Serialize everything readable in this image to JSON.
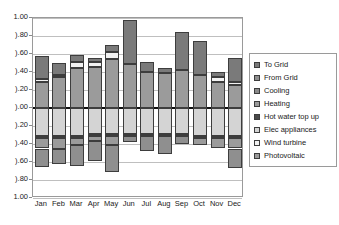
{
  "chart_data": {
    "type": "bar",
    "title": "",
    "subtitle": "",
    "xlabel": "",
    "ylabel": "",
    "stacked": true,
    "diverging": true,
    "grid": true,
    "legend_position": "right",
    "categories": [
      "Jan",
      "Feb",
      "Mar",
      "Apr",
      "May",
      "Jun",
      "Jul",
      "Aug",
      "Sep",
      "Oct",
      "Nov",
      "Dec"
    ],
    "ylim": [
      -1.0,
      1.0
    ],
    "ytick_step": 0.2,
    "ytick_labels": [
      "1.00",
      "0.80",
      "0.60",
      "0.40",
      "0.20",
      "0.00",
      "-0.20",
      "-0.40",
      "-0.60",
      "-0.80",
      "-1.00"
    ],
    "ytick_values": [
      1.0,
      0.8,
      0.6,
      0.4,
      0.2,
      0.0,
      -0.2,
      -0.4,
      -0.6,
      -0.8,
      -1.0
    ],
    "ytick_labels_clipped": [
      "1.00",
      ").80",
      ").60",
      ").40",
      ").20",
      ").00",
      ").20",
      ").40",
      ").60",
      ").80",
      "1.00"
    ],
    "series": [
      {
        "name": "To Grid",
        "color": "#7a7a7a",
        "sign": "positive",
        "values": [
          0.26,
          0.13,
          0.08,
          0.05,
          0.08,
          0.49,
          0.11,
          0.06,
          0.42,
          0.37,
          0.06,
          0.27
        ]
      },
      {
        "name": "From Grid",
        "color": "#8f8f8f",
        "sign": "negative",
        "values": [
          -0.21,
          -0.16,
          -0.23,
          -0.22,
          -0.3,
          -0.07,
          -0.17,
          -0.2,
          -0.09,
          -0.0,
          -0.0,
          -0.22
        ]
      },
      {
        "name": "Cooling",
        "color": "#8a8a8a",
        "sign": "negative",
        "values": [
          0.0,
          0.0,
          0.0,
          0.0,
          0.0,
          0.0,
          0.0,
          0.0,
          0.0,
          0.0,
          0.0,
          0.0
        ]
      },
      {
        "name": "Heating",
        "color": "#9b9b9b",
        "sign": "negative",
        "values": [
          -0.12,
          -0.13,
          -0.08,
          -0.06,
          -0.1,
          -0.0,
          -0.0,
          -0.0,
          -0.0,
          -0.08,
          -0.12,
          -0.12
        ]
      },
      {
        "name": "Hot water top up",
        "color": "#4a4a4a",
        "sign": "negative",
        "values": [
          -0.02,
          -0.02,
          -0.02,
          -0.02,
          -0.02,
          -0.02,
          -0.02,
          -0.02,
          -0.02,
          -0.02,
          -0.02,
          -0.02
        ]
      },
      {
        "name": "Elec appliances",
        "color": "#d4d4d4",
        "sign": "negative",
        "values": [
          -0.31,
          -0.31,
          -0.31,
          -0.29,
          -0.29,
          -0.29,
          -0.29,
          -0.29,
          -0.29,
          -0.31,
          -0.31,
          -0.31
        ]
      },
      {
        "name": "Wind turbine",
        "color": "#f2f2f2",
        "sign": "positive",
        "values": [
          0.03,
          0.03,
          0.07,
          0.05,
          0.08,
          0.0,
          0.0,
          0.0,
          0.0,
          0.0,
          0.05,
          0.03
        ]
      },
      {
        "name": "Photovoltaic",
        "color": "#9b9b9b",
        "sign": "positive",
        "values": [
          0.29,
          0.34,
          0.44,
          0.46,
          0.54,
          0.49,
          0.4,
          0.39,
          0.42,
          0.37,
          0.29,
          0.26
        ]
      }
    ],
    "stack_positive_order": [
      "Photovoltaic",
      "Wind turbine",
      "To Grid"
    ],
    "stack_negative_order": [
      "Elec appliances",
      "Hot water top up",
      "Heating",
      "Cooling",
      "From Grid"
    ],
    "bar_totals_positive": [
      0.58,
      0.5,
      0.53,
      0.51,
      0.62,
      0.49,
      0.52,
      0.46,
      0.42,
      0.37,
      0.35,
      0.53
    ],
    "bar_totals_negative": [
      -0.56,
      -0.57,
      -0.52,
      -0.52,
      -0.62,
      -0.43,
      -0.51,
      -0.48,
      -0.43,
      -0.36,
      -0.35,
      -0.56
    ]
  },
  "legend": {
    "items": [
      {
        "label": "To Grid",
        "color": "#7a7a7a"
      },
      {
        "label": "From Grid",
        "color": "#8f8f8f"
      },
      {
        "label": "Cooling",
        "color": "#8a8a8a"
      },
      {
        "label": "Heating",
        "color": "#9b9b9b"
      },
      {
        "label": "Hot water top up",
        "color": "#4a4a4a"
      },
      {
        "label": "Elec appliances",
        "color": "#d4d4d4"
      },
      {
        "label": "Wind turbine",
        "color": "#f2f2f2"
      },
      {
        "label": "Photovoltaic",
        "color": "#9b9b9b"
      }
    ]
  }
}
